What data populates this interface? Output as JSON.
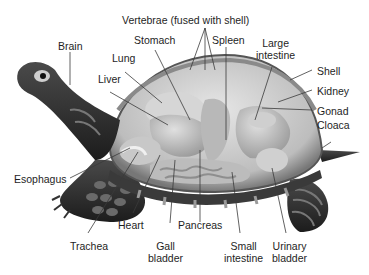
{
  "diagram": {
    "labels": {
      "vertebrae": "Vertebrae (fused with shell)",
      "brain": "Brain",
      "stomach": "Stomach",
      "spleen": "Spleen",
      "large_intestine_1": "Large",
      "large_intestine_2": "intestine",
      "lung": "Lung",
      "liver": "Liver",
      "shell": "Shell",
      "kidney": "Kidney",
      "gonad": "Gonad",
      "cloaca": "Cloaca",
      "esophagus": "Esophagus",
      "heart": "Heart",
      "pancreas": "Pancreas",
      "trachea": "Trachea",
      "gall_bladder_1": "Gall",
      "gall_bladder_2": "bladder",
      "small_intestine_1": "Small",
      "small_intestine_2": "intestine",
      "urinary_bladder_1": "Urinary",
      "urinary_bladder_2": "bladder"
    },
    "colors": {
      "skin_dark": "#2a2a2a",
      "skin_mid": "#5a5a5a",
      "shell_clear": "#d8d8d8",
      "organ_light": "#c4c4c4",
      "organ_mid": "#a8a8a8",
      "leader_line": "#3a3a3a"
    }
  }
}
